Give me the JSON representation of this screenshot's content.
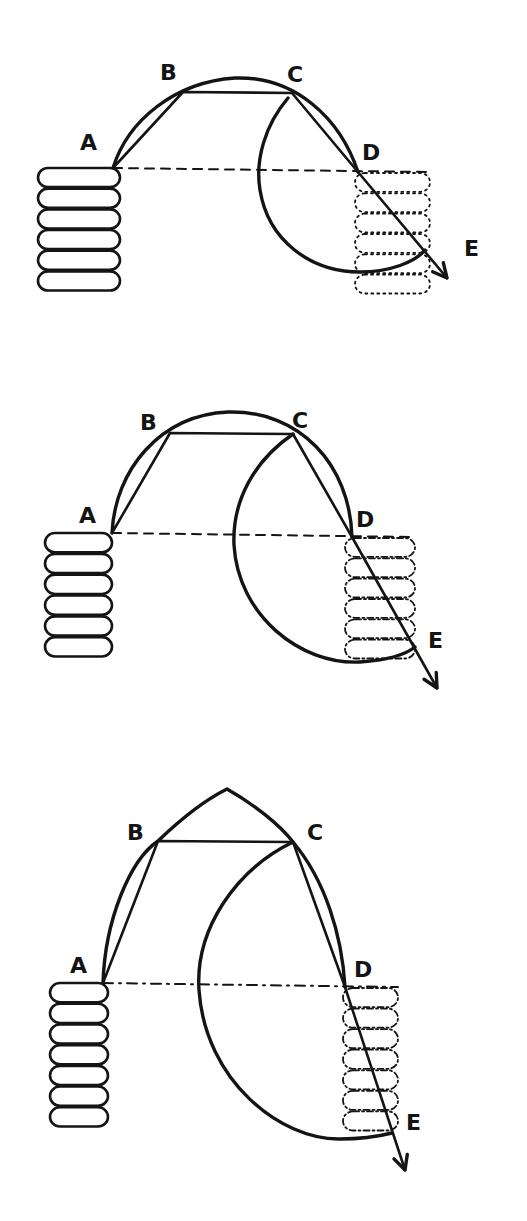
{
  "figure": {
    "ink_color": "#141414",
    "background": "#ffffff"
  },
  "panels": [
    {
      "id": "panel-1",
      "labels": {
        "A": "A",
        "B": "B",
        "C": "C",
        "D": "D",
        "E": "E"
      },
      "left_stack_discs": 6,
      "right_stack_discs": 6,
      "right_stack_style": "dotted",
      "baseline_style": "dashed",
      "top_shape": "round-arc"
    },
    {
      "id": "panel-2",
      "labels": {
        "A": "A",
        "B": "B",
        "C": "C",
        "D": "D",
        "E": "E"
      },
      "left_stack_discs": 6,
      "right_stack_discs": 6,
      "right_stack_style": "dash-dot",
      "baseline_style": "dashed",
      "top_shape": "round-arc"
    },
    {
      "id": "panel-3",
      "labels": {
        "A": "A",
        "B": "B",
        "C": "C",
        "D": "D",
        "E": "E"
      },
      "left_stack_discs": 7,
      "right_stack_discs": 7,
      "right_stack_style": "dash-dot",
      "baseline_style": "dash-dot",
      "top_shape": "pointed-arc"
    }
  ]
}
